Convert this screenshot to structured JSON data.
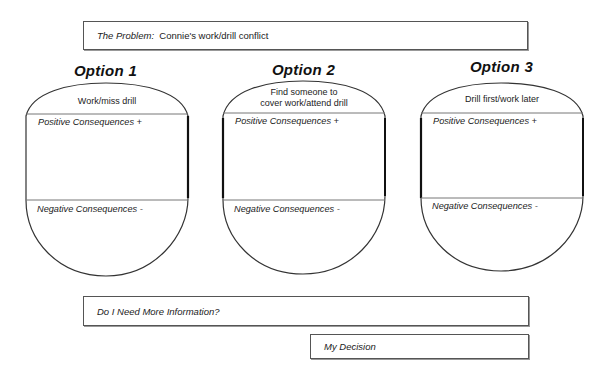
{
  "problem": {
    "label": "The Problem:",
    "value": "Connie's work/drill conflict"
  },
  "options": [
    {
      "title": "Option 1",
      "description": "Work/miss drill",
      "positive_label": "Positive Consequences +",
      "negative_label": "Negative Consequences -"
    },
    {
      "title": "Option 2",
      "description_line1": "Find someone to",
      "description_line2": "cover work/attend drill",
      "positive_label": "Positive Consequences +",
      "negative_label": "Negative Consequences -"
    },
    {
      "title": "Option 3",
      "description": "Drill first/work later",
      "positive_label": "Positive Consequences +",
      "negative_label": "Negative Consequences -"
    }
  ],
  "more_info": {
    "label": "Do I Need More Information?"
  },
  "decision": {
    "label": "My Decision"
  },
  "colors": {
    "stroke": "#333333",
    "divider": "#777777",
    "background": "#ffffff"
  }
}
